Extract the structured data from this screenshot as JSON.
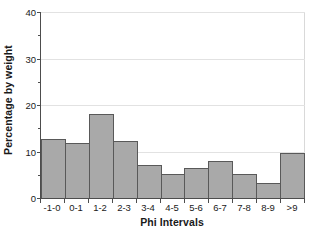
{
  "chart_data": {
    "type": "bar",
    "title": "",
    "subtitle": "",
    "xlabel": "Phi Intervals",
    "ylabel": "Percentage by weight",
    "categories": [
      "-1-0",
      "0-1",
      "1-2",
      "2-3",
      "3-4",
      "4-5",
      "5-6",
      "6-7",
      "7-8",
      "8-9",
      ">9"
    ],
    "values": [
      12.7,
      11.8,
      18.1,
      12.2,
      7.1,
      5.2,
      6.5,
      8.0,
      5.1,
      3.2,
      9.7
    ],
    "ylim": [
      0,
      40
    ],
    "y_major_ticks": [
      0,
      10,
      20,
      30,
      40
    ],
    "y_tick_labels": [
      "0",
      "10",
      "20",
      "30",
      "40"
    ],
    "y_minor_ticks": [
      5,
      15,
      25,
      35
    ],
    "grid": true,
    "grid_axis": "y",
    "legend": false,
    "legend_position": "none",
    "bar_fill_color": "#a9a9a9",
    "bar_border_color": "#595959",
    "axis_color": "#4d4d4d",
    "gridline_color": "#e2e2e2",
    "background_color": "#ffffff",
    "text_color": "#1a1a1a"
  }
}
